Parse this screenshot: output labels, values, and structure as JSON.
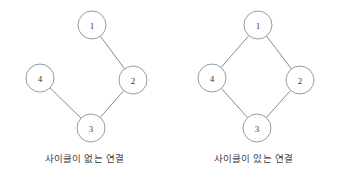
{
  "figure": {
    "background_color": "#ffffff",
    "width": 338,
    "height": 180,
    "node_stroke_color": "#9a9a9a",
    "edge_stroke_color": "#8a8a8a",
    "label_color": "#3a3a3a",
    "caption_color": "#3c3c3c"
  },
  "panels": [
    {
      "id": "acyclic",
      "caption": "사이클이 없는 연결",
      "nodes": [
        {
          "id": "1",
          "label": "1",
          "cx": 92,
          "cy": 25,
          "r": 14
        },
        {
          "id": "2",
          "label": "2",
          "cx": 133,
          "cy": 80,
          "r": 14
        },
        {
          "id": "3",
          "label": "3",
          "cx": 91,
          "cy": 128,
          "r": 14
        },
        {
          "id": "4",
          "label": "4",
          "cx": 40,
          "cy": 78,
          "r": 14
        }
      ],
      "edges": [
        {
          "from": "1",
          "to": "2"
        },
        {
          "from": "2",
          "to": "3"
        },
        {
          "from": "3",
          "to": "4"
        }
      ]
    },
    {
      "id": "cyclic",
      "caption": "사이클이 있는 연결",
      "nodes": [
        {
          "id": "1",
          "label": "1",
          "cx": 89,
          "cy": 25,
          "r": 14
        },
        {
          "id": "2",
          "label": "2",
          "cx": 131,
          "cy": 80,
          "r": 14
        },
        {
          "id": "3",
          "label": "3",
          "cx": 88,
          "cy": 128,
          "r": 14
        },
        {
          "id": "4",
          "label": "4",
          "cx": 43,
          "cy": 78,
          "r": 14
        }
      ],
      "edges": [
        {
          "from": "1",
          "to": "2"
        },
        {
          "from": "2",
          "to": "3"
        },
        {
          "from": "3",
          "to": "4"
        },
        {
          "from": "4",
          "to": "1"
        }
      ]
    }
  ]
}
